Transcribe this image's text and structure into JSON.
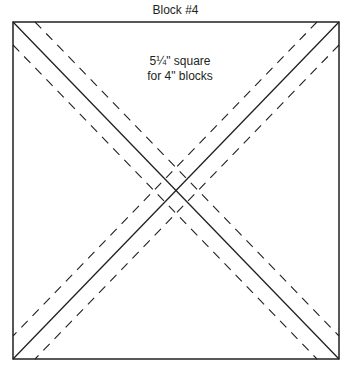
{
  "title": "Block #4",
  "label": {
    "line1": "5¼\" square",
    "line2": "for 4\" blocks"
  },
  "colors": {
    "line": "#231f20",
    "background": "#ffffff"
  },
  "square": {
    "x": 13,
    "y": 22,
    "width": 326,
    "height": 337
  },
  "dash_offset_px": 22
}
